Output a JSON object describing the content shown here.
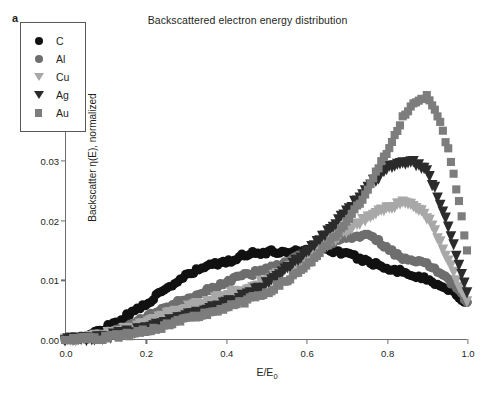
{
  "panel": {
    "label": "a"
  },
  "chart_data": {
    "type": "scatter",
    "title": "Backscattered electron energy distribution",
    "xlabel": "E/E0",
    "xlabel_parts": {
      "base": "E/E",
      "sub": "0"
    },
    "ylabel": "Backscatter η(E), normalized",
    "xlim": [
      0.0,
      1.0
    ],
    "ylim": [
      0.0,
      0.05
    ],
    "xticks": [
      0.0,
      0.2,
      0.4,
      0.6,
      0.8,
      1.0
    ],
    "xticklabels": [
      "0.0",
      "0.2",
      "0.4",
      "0.6",
      "0.8",
      "1.0"
    ],
    "yticks": [
      0.0,
      0.01,
      0.02,
      0.03,
      0.04,
      0.05
    ],
    "yticklabels": [
      "0.00",
      "0.01",
      "0.02",
      "0.03",
      "0.04",
      "0.05"
    ],
    "grid": false,
    "legend_position": "upper-left-inset",
    "marker_size": 4.6,
    "series": [
      {
        "name": "C",
        "marker": "circle",
        "color": "#111111",
        "x": [
          0.02,
          0.04,
          0.06,
          0.08,
          0.1,
          0.12,
          0.14,
          0.16,
          0.18,
          0.2,
          0.22,
          0.24,
          0.26,
          0.28,
          0.3,
          0.32,
          0.34,
          0.36,
          0.38,
          0.4,
          0.42,
          0.44,
          0.46,
          0.48,
          0.5,
          0.52,
          0.54,
          0.56,
          0.58,
          0.6,
          0.62,
          0.64,
          0.66,
          0.68,
          0.7,
          0.72,
          0.74,
          0.76,
          0.78,
          0.8,
          0.82,
          0.84,
          0.86,
          0.88,
          0.9,
          0.92,
          0.94,
          0.96,
          0.98,
          1.0
        ],
        "y": [
          0.0002,
          0.0004,
          0.0008,
          0.0014,
          0.0021,
          0.0028,
          0.0035,
          0.0043,
          0.0052,
          0.0061,
          0.007,
          0.0079,
          0.0089,
          0.0098,
          0.0107,
          0.0114,
          0.012,
          0.0127,
          0.0128,
          0.0129,
          0.0136,
          0.0142,
          0.0146,
          0.0146,
          0.0147,
          0.0148,
          0.0148,
          0.0148,
          0.015,
          0.0152,
          0.0153,
          0.0152,
          0.0151,
          0.0148,
          0.0144,
          0.014,
          0.0135,
          0.013,
          0.0126,
          0.0122,
          0.0118,
          0.0114,
          0.011,
          0.0106,
          0.0101,
          0.0096,
          0.009,
          0.0083,
          0.0073,
          0.0062
        ]
      },
      {
        "name": "Al",
        "marker": "circle",
        "color": "#6e6e6e",
        "x": [
          0.02,
          0.04,
          0.06,
          0.08,
          0.1,
          0.12,
          0.14,
          0.16,
          0.18,
          0.2,
          0.22,
          0.24,
          0.26,
          0.28,
          0.3,
          0.32,
          0.34,
          0.36,
          0.38,
          0.4,
          0.42,
          0.44,
          0.46,
          0.48,
          0.5,
          0.52,
          0.54,
          0.56,
          0.58,
          0.6,
          0.62,
          0.64,
          0.66,
          0.68,
          0.7,
          0.72,
          0.74,
          0.76,
          0.78,
          0.8,
          0.82,
          0.84,
          0.86,
          0.88,
          0.9,
          0.92,
          0.94,
          0.96,
          0.98,
          1.0
        ],
        "y": [
          0.0002,
          0.0003,
          0.0005,
          0.0008,
          0.0012,
          0.0017,
          0.0022,
          0.0027,
          0.0033,
          0.0039,
          0.0045,
          0.0051,
          0.0057,
          0.0063,
          0.0068,
          0.0073,
          0.0079,
          0.0085,
          0.0091,
          0.0097,
          0.0103,
          0.0108,
          0.0111,
          0.0114,
          0.0118,
          0.0123,
          0.0128,
          0.0133,
          0.0139,
          0.0145,
          0.0151,
          0.0157,
          0.0163,
          0.0168,
          0.0172,
          0.0175,
          0.0176,
          0.0173,
          0.0166,
          0.0156,
          0.0145,
          0.0137,
          0.0132,
          0.013,
          0.0127,
          0.012,
          0.011,
          0.0097,
          0.0081,
          0.0064
        ]
      },
      {
        "name": "Cu",
        "marker": "triangle-down",
        "color": "#a8a8a8",
        "x": [
          0.02,
          0.04,
          0.06,
          0.08,
          0.1,
          0.12,
          0.14,
          0.16,
          0.18,
          0.2,
          0.22,
          0.24,
          0.26,
          0.28,
          0.3,
          0.32,
          0.34,
          0.36,
          0.38,
          0.4,
          0.42,
          0.44,
          0.46,
          0.48,
          0.5,
          0.52,
          0.54,
          0.56,
          0.58,
          0.6,
          0.62,
          0.64,
          0.66,
          0.68,
          0.7,
          0.72,
          0.74,
          0.76,
          0.78,
          0.8,
          0.82,
          0.84,
          0.86,
          0.88,
          0.9,
          0.92,
          0.94,
          0.96,
          0.98,
          1.0
        ],
        "y": [
          0.0001,
          0.0002,
          0.0004,
          0.0006,
          0.0009,
          0.0012,
          0.0016,
          0.002,
          0.0024,
          0.0029,
          0.0034,
          0.0039,
          0.0044,
          0.0049,
          0.0054,
          0.0058,
          0.0063,
          0.0067,
          0.0071,
          0.0075,
          0.0079,
          0.0084,
          0.0089,
          0.0094,
          0.01,
          0.0107,
          0.0114,
          0.0122,
          0.013,
          0.0139,
          0.0148,
          0.0157,
          0.0166,
          0.0175,
          0.0184,
          0.0193,
          0.0202,
          0.021,
          0.0217,
          0.0222,
          0.0226,
          0.0229,
          0.0228,
          0.0221,
          0.0206,
          0.0183,
          0.0155,
          0.0124,
          0.0093,
          0.0068
        ]
      },
      {
        "name": "Ag",
        "marker": "triangle-down",
        "color": "#2b2b2b",
        "x": [
          0.02,
          0.04,
          0.06,
          0.08,
          0.1,
          0.12,
          0.14,
          0.16,
          0.18,
          0.2,
          0.22,
          0.24,
          0.26,
          0.28,
          0.3,
          0.32,
          0.34,
          0.36,
          0.38,
          0.4,
          0.42,
          0.44,
          0.46,
          0.48,
          0.5,
          0.52,
          0.54,
          0.56,
          0.58,
          0.6,
          0.62,
          0.64,
          0.66,
          0.68,
          0.7,
          0.72,
          0.74,
          0.76,
          0.78,
          0.8,
          0.82,
          0.84,
          0.86,
          0.88,
          0.9,
          0.92,
          0.94,
          0.96,
          0.98,
          1.0
        ],
        "y": [
          0.0001,
          0.0002,
          0.0003,
          0.0004,
          0.0006,
          0.0008,
          0.0011,
          0.0014,
          0.0017,
          0.002,
          0.0024,
          0.0028,
          0.0032,
          0.0036,
          0.004,
          0.0044,
          0.0048,
          0.0052,
          0.0057,
          0.0062,
          0.0067,
          0.0073,
          0.0079,
          0.0086,
          0.0094,
          0.0103,
          0.0113,
          0.0124,
          0.0136,
          0.0148,
          0.0161,
          0.0174,
          0.0188,
          0.0202,
          0.0216,
          0.0231,
          0.0246,
          0.0261,
          0.0275,
          0.0287,
          0.0295,
          0.0299,
          0.03,
          0.0296,
          0.0282,
          0.0255,
          0.0218,
          0.0176,
          0.0128,
          0.008
        ]
      },
      {
        "name": "Au",
        "marker": "square",
        "color": "#7d7d7d",
        "x": [
          0.02,
          0.04,
          0.06,
          0.08,
          0.1,
          0.12,
          0.14,
          0.16,
          0.18,
          0.2,
          0.22,
          0.24,
          0.26,
          0.28,
          0.3,
          0.32,
          0.34,
          0.36,
          0.38,
          0.4,
          0.42,
          0.44,
          0.46,
          0.48,
          0.5,
          0.52,
          0.54,
          0.56,
          0.58,
          0.6,
          0.62,
          0.64,
          0.66,
          0.68,
          0.7,
          0.72,
          0.74,
          0.76,
          0.78,
          0.8,
          0.82,
          0.84,
          0.86,
          0.88,
          0.9,
          0.92,
          0.94,
          0.96,
          0.98,
          1.0
        ],
        "y": [
          0.0001,
          0.0001,
          0.0002,
          0.0003,
          0.0004,
          0.0006,
          0.0008,
          0.001,
          0.0013,
          0.0016,
          0.0019,
          0.0022,
          0.0026,
          0.003,
          0.0034,
          0.0038,
          0.0042,
          0.0046,
          0.005,
          0.0054,
          0.0058,
          0.0063,
          0.0068,
          0.0074,
          0.008,
          0.0087,
          0.0095,
          0.0104,
          0.0114,
          0.0125,
          0.0137,
          0.015,
          0.0164,
          0.018,
          0.0197,
          0.0216,
          0.0237,
          0.0262,
          0.0288,
          0.0315,
          0.0345,
          0.0372,
          0.0392,
          0.0399,
          0.041,
          0.0386,
          0.0352,
          0.0302,
          0.0232,
          0.015
        ]
      }
    ]
  },
  "legend": {
    "entries": [
      {
        "label": "C",
        "marker": "circle",
        "color": "#111111"
      },
      {
        "label": "Al",
        "marker": "circle",
        "color": "#6e6e6e"
      },
      {
        "label": "Cu",
        "marker": "triangle-down",
        "color": "#a8a8a8"
      },
      {
        "label": "Ag",
        "marker": "triangle-down",
        "color": "#2b2b2b"
      },
      {
        "label": "Au",
        "marker": "square",
        "color": "#7d7d7d"
      }
    ]
  }
}
